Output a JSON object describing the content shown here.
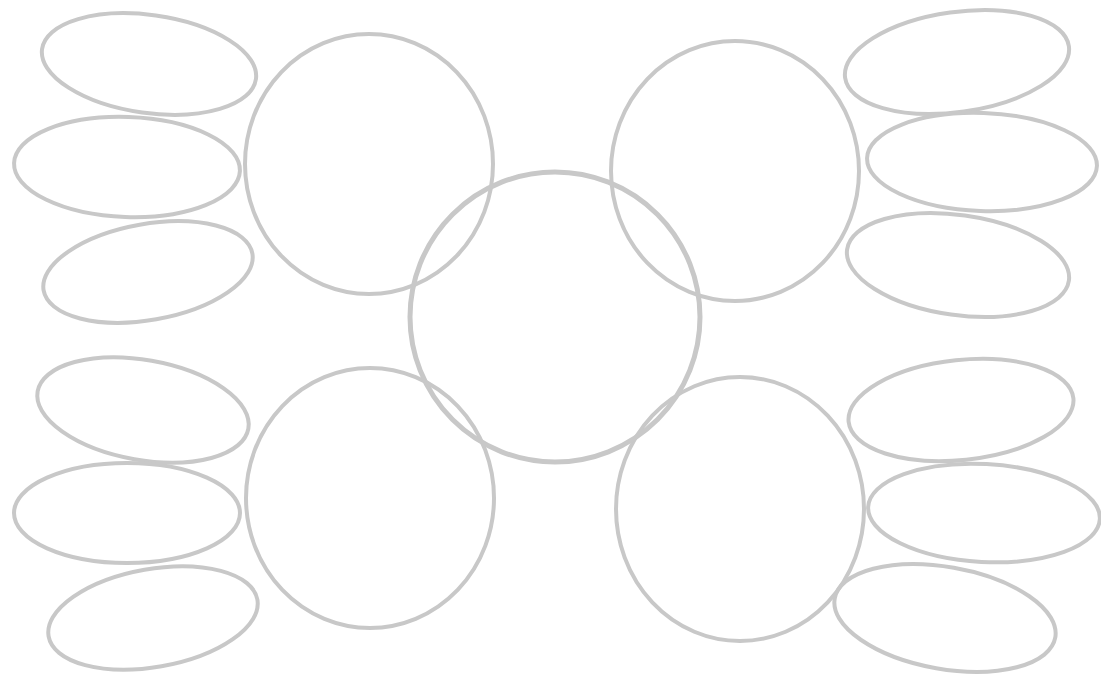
{
  "diagram": {
    "type": "graphic-organizer",
    "stroke_color": "#c8c8c8",
    "background": "#ffffff",
    "hub": {
      "cx": 555,
      "cy": 317,
      "r": 145,
      "label": ""
    },
    "satellites": [
      {
        "id": "top-left",
        "cx": 369,
        "cy": 164,
        "rx": 124,
        "ry": 130,
        "label": "",
        "leaves": [
          {
            "cx": 149,
            "cy": 64,
            "rx": 108,
            "ry": 49,
            "rot": 8,
            "label": ""
          },
          {
            "cx": 127,
            "cy": 167,
            "rx": 113,
            "ry": 50,
            "rot": 2,
            "label": ""
          },
          {
            "cx": 148,
            "cy": 272,
            "rx": 106,
            "ry": 48,
            "rot": -10,
            "label": ""
          }
        ]
      },
      {
        "id": "top-right",
        "cx": 735,
        "cy": 171,
        "rx": 124,
        "ry": 130,
        "label": "",
        "leaves": [
          {
            "cx": 957,
            "cy": 62,
            "rx": 113,
            "ry": 50,
            "rot": -8,
            "label": ""
          },
          {
            "cx": 982,
            "cy": 162,
            "rx": 115,
            "ry": 49,
            "rot": 2,
            "label": ""
          },
          {
            "cx": 958,
            "cy": 265,
            "rx": 112,
            "ry": 50,
            "rot": 8,
            "label": ""
          }
        ]
      },
      {
        "id": "bottom-left",
        "cx": 370,
        "cy": 498,
        "rx": 124,
        "ry": 130,
        "label": "",
        "leaves": [
          {
            "cx": 143,
            "cy": 410,
            "rx": 107,
            "ry": 50,
            "rot": 10,
            "label": ""
          },
          {
            "cx": 127,
            "cy": 513,
            "rx": 113,
            "ry": 50,
            "rot": 0,
            "label": ""
          },
          {
            "cx": 153,
            "cy": 618,
            "rx": 106,
            "ry": 49,
            "rot": -10,
            "label": ""
          }
        ]
      },
      {
        "id": "bottom-right",
        "cx": 740,
        "cy": 509,
        "rx": 124,
        "ry": 132,
        "label": "",
        "leaves": [
          {
            "cx": 961,
            "cy": 410,
            "rx": 113,
            "ry": 50,
            "rot": -6,
            "label": ""
          },
          {
            "cx": 984,
            "cy": 513,
            "rx": 116,
            "ry": 49,
            "rot": 3,
            "label": ""
          },
          {
            "cx": 945,
            "cy": 618,
            "rx": 112,
            "ry": 51,
            "rot": 10,
            "label": ""
          }
        ]
      }
    ]
  }
}
